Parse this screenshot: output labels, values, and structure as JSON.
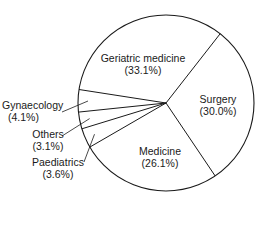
{
  "chart_data": {
    "type": "pie",
    "title": "",
    "categories": [
      "Surgery",
      "Medicine",
      "Paediatrics",
      "Others",
      "Gynaecology",
      "Geriatric medicine"
    ],
    "values": [
      30.0,
      26.1,
      3.6,
      3.1,
      4.1,
      33.1
    ],
    "unit": "%",
    "labels": [
      {
        "name": "Surgery",
        "pct": "(30.0%)"
      },
      {
        "name": "Medicine",
        "pct": "(26.1%)"
      },
      {
        "name": "Paediatrics",
        "pct": "(3.6%)"
      },
      {
        "name": "Others",
        "pct": "(3.1%)"
      },
      {
        "name": "Gynaecology",
        "pct": "(4.1%)"
      },
      {
        "name": "Geriatric medicine",
        "pct": "(33.1%)"
      }
    ],
    "colors": {
      "stroke": "#1a1a1a",
      "fill": "#ffffff"
    },
    "legend": "none",
    "grid": false
  }
}
